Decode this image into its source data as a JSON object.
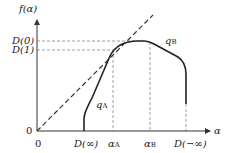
{
  "diagram": {
    "y_axis_label": "f(α)",
    "x_axis_label": "α",
    "origin_y_label": "0",
    "origin_x_label": "0",
    "y_ticks": [
      {
        "label": "D(0)",
        "y": 41
      },
      {
        "label": "D(1)",
        "y": 50
      }
    ],
    "x_ticks": [
      {
        "label": "D(∞)",
        "x": 84
      },
      {
        "label": "α",
        "sub": "A",
        "x": 113
      },
      {
        "label": "α",
        "sub": "B",
        "x": 150
      },
      {
        "label": "D(−∞)",
        "x": 186
      }
    ],
    "curve_labels": [
      {
        "label": "q",
        "sub": "A"
      },
      {
        "label": "q",
        "sub": "B"
      }
    ],
    "colors": {
      "curve": "#222222",
      "axis": "#333333",
      "dashed": "#777777"
    }
  }
}
